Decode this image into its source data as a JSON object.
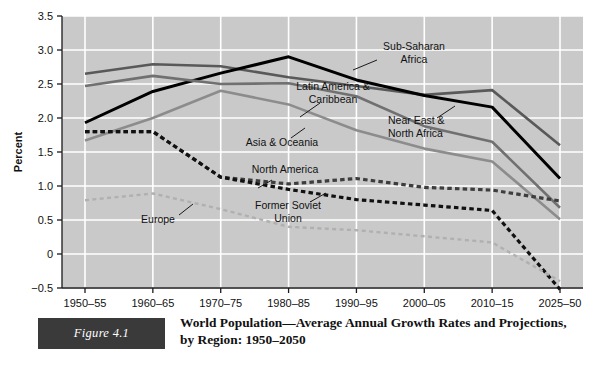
{
  "figure": {
    "badge_label": "Figure 4.1",
    "caption_line1": "World Population—Average Annual Growth Rates and Projections,",
    "caption_line2": "by Region: 1950–2050",
    "badge_color": "#3a3a3a"
  },
  "chart_data": {
    "type": "line",
    "title": "World Population—Average Annual Growth Rates and Projections, by Region: 1950–2050",
    "xlabel": "",
    "ylabel": "Percent",
    "ylim": [
      -0.5,
      3.5
    ],
    "yticks": [
      3.5,
      3.0,
      2.5,
      2.0,
      1.5,
      1.0,
      0.5,
      0,
      -0.5
    ],
    "ytick_labels": [
      "3.5",
      "3.0",
      "2.5",
      "2.0",
      "1.5",
      "1.0",
      "0.5",
      "0",
      "−0.5"
    ],
    "categories": [
      "1950–55",
      "1960–65",
      "1970–75",
      "1980–85",
      "1990–95",
      "2000–05",
      "2010–15",
      "2025–50"
    ],
    "grid": true,
    "plot_background": "#c9c9c9",
    "grid_color": "#ffffff",
    "legend_position": "inline-annotations",
    "series": [
      {
        "name": "Sub-Saharan Africa",
        "color": "#595959",
        "style": "solid",
        "width": 2.6,
        "values": [
          2.65,
          2.79,
          2.76,
          2.6,
          2.47,
          2.34,
          2.41,
          1.6
        ],
        "label_x": 414,
        "label_y": 50,
        "label_lines": [
          "Sub-Saharan",
          "Africa"
        ],
        "label_anchor": "middle",
        "leader": [
          [
            377,
            60
          ],
          [
            353,
            70
          ]
        ]
      },
      {
        "name": "Near East & North Africa",
        "color": "#000000",
        "style": "solid",
        "width": 3.0,
        "values": [
          1.93,
          2.39,
          2.66,
          2.9,
          2.56,
          2.33,
          2.16,
          1.11
        ],
        "label_x": 388,
        "label_y": 124,
        "label_lines": [
          "Near East &",
          "North Africa"
        ],
        "label_anchor": "start",
        "leader": [
          [
            437,
            118
          ],
          [
            455,
            106
          ]
        ]
      },
      {
        "name": "Latin America & Caribbean",
        "color": "#707070",
        "style": "solid",
        "width": 2.6,
        "values": [
          2.47,
          2.62,
          2.5,
          2.51,
          2.32,
          1.88,
          1.65,
          0.68
        ],
        "label_x": 333,
        "label_y": 90,
        "label_lines": [
          "Latin America &",
          "Caribbean"
        ],
        "label_anchor": "middle",
        "leader": [
          [
            320,
            103
          ],
          [
            300,
            117
          ]
        ]
      },
      {
        "name": "Asia & Oceania",
        "color": "#8c8c8c",
        "style": "solid",
        "width": 2.6,
        "values": [
          1.67,
          2.0,
          2.4,
          2.2,
          1.82,
          1.55,
          1.36,
          0.51
        ],
        "label_x": 282,
        "label_y": 146,
        "label_lines": [
          "Asia & Oceania"
        ],
        "label_anchor": "middle",
        "leader": [
          [
            291,
            138
          ],
          [
            305,
            128
          ]
        ]
      },
      {
        "name": "North America",
        "color": "#3d3d3d",
        "style": "dashed",
        "width": 3.2,
        "values": [
          1.8,
          1.8,
          1.13,
          1.03,
          1.11,
          0.98,
          0.94,
          0.78
        ],
        "label_x": 285,
        "label_y": 173,
        "label_lines": [
          "North America"
        ],
        "label_anchor": "middle",
        "leader": [
          [
            272,
            180
          ],
          [
            258,
            188
          ]
        ]
      },
      {
        "name": "Former Soviet Union",
        "color": "#111111",
        "style": "dashed",
        "width": 3.2,
        "values": [
          1.8,
          1.8,
          1.13,
          0.95,
          0.8,
          0.72,
          0.64,
          -0.52
        ],
        "label_x": 288,
        "label_y": 209,
        "label_lines": [
          "Former Soviet",
          "Union"
        ],
        "label_anchor": "middle",
        "leader": [
          [
            310,
            202
          ],
          [
            326,
            193
          ]
        ]
      },
      {
        "name": "Europe",
        "color": "#b0b0b0",
        "style": "dashed",
        "width": 2.4,
        "values": [
          0.79,
          0.89,
          0.66,
          0.4,
          0.35,
          0.26,
          0.17,
          -0.4
        ],
        "label_x": 158,
        "label_y": 223,
        "label_lines": [
          "Europe"
        ],
        "label_anchor": "middle",
        "leader": [
          [
            179,
            215
          ],
          [
            193,
            204
          ]
        ]
      }
    ]
  }
}
